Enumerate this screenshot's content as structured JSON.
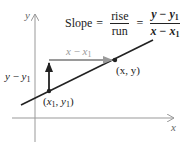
{
  "formula": {
    "prefix": "Slope",
    "eq1": "=",
    "frac1_num": "rise",
    "frac1_den": "run",
    "eq2": "=",
    "frac2_num_a": "y",
    "frac2_num_op": " − ",
    "frac2_num_b": "y",
    "frac2_num_sub": "1",
    "frac2_den_a": "x",
    "frac2_den_op": " − ",
    "frac2_den_b": "x",
    "frac2_den_sub": "1"
  },
  "axes": {
    "x_label": "x",
    "y_label": "y"
  },
  "labels": {
    "run_a": "x",
    "run_op": " − ",
    "run_b": "x",
    "run_sub": "1",
    "rise_a": "y",
    "rise_op": " − ",
    "rise_b": "y",
    "rise_sub": "1",
    "point2": "(x, y)",
    "point1_open": "(",
    "point1_x": "x",
    "point1_xsub": "1",
    "point1_sep": ", ",
    "point1_y": "y",
    "point1_ysub": "1",
    "point1_close": ")"
  },
  "colors": {
    "axis": "#999999",
    "line": "#222222",
    "run_arrow": "#9a9a9a",
    "rise_arrow": "#222222",
    "run_label": "#9a9a9a"
  }
}
